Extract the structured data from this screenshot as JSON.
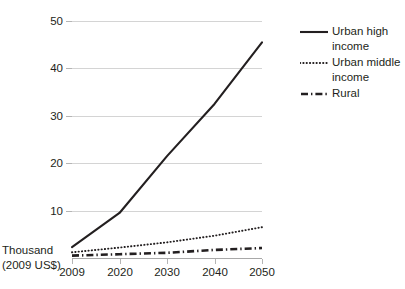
{
  "chart_data": {
    "type": "line",
    "title": "",
    "subtitle": "",
    "xlabel": "",
    "ylabel": "Thousand (2009 US$)",
    "ylabel_lines": [
      "Thousand",
      "(2009 US$)"
    ],
    "categories": [
      "2009",
      "2020",
      "2030",
      "2040",
      "2050"
    ],
    "x": [
      2009,
      2020,
      2030,
      2040,
      2050
    ],
    "ylim": [
      0,
      50
    ],
    "yticks": [
      10,
      20,
      30,
      40,
      50
    ],
    "ytick_labels": [
      "10",
      "20",
      "30",
      "40",
      "50"
    ],
    "grid": true,
    "grid_axis": "y",
    "legend_position": "right",
    "series": [
      {
        "name": "Urban high income",
        "name_lines": [
          "Urban high",
          "income"
        ],
        "style": "solid",
        "color": "#231f20",
        "values": [
          2.3,
          9.5,
          21.5,
          32.5,
          45.5
        ]
      },
      {
        "name": "Urban middle income",
        "name_lines": [
          "Urban middle",
          "income"
        ],
        "style": "dotted",
        "color": "#231f20",
        "values": [
          1.2,
          2.2,
          3.3,
          4.7,
          6.5
        ]
      },
      {
        "name": "Rural",
        "name_lines": [
          "Rural"
        ],
        "style": "dash-dot",
        "color": "#231f20",
        "values": [
          0.5,
          0.8,
          1.1,
          1.7,
          2.1
        ]
      }
    ]
  },
  "axis": {
    "y_labels": [
      "50",
      "40",
      "30",
      "20",
      "10"
    ],
    "x_labels": [
      "2009",
      "2020",
      "2030",
      "2040",
      "2050"
    ],
    "title_line1": "Thousand",
    "title_line2": "(2009 US$)"
  },
  "legend": {
    "items": [
      {
        "label_line1": "Urban high",
        "label_line2": "income",
        "swatch": "solid-line-icon"
      },
      {
        "label_line1": "Urban middle",
        "label_line2": "income",
        "swatch": "dotted-line-icon"
      },
      {
        "label_line1": "Rural",
        "label_line2": "",
        "swatch": "dash-dot-line-icon"
      }
    ]
  },
  "colors": {
    "ink": "#231f20",
    "gridline": "#d4d4d4",
    "axis": "#a8a8a8",
    "background": "#ffffff"
  }
}
